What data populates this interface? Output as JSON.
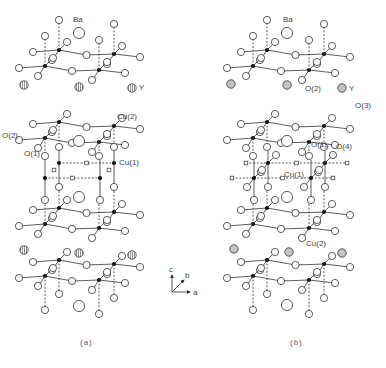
{
  "figure": {
    "width": 386,
    "height": 368,
    "colors": {
      "background": "#ffffff",
      "stroke": "#333333",
      "cu_fill": "#111111",
      "o_fill": "#ffffff",
      "ba_fill": "#ffffff",
      "y_fill_a": "#bbbbbb",
      "y_fill_b": "#c4c4c4",
      "label": "#444444"
    }
  },
  "panels": [
    {
      "id": "a",
      "caption": "(a)",
      "caption_pos": [
        80,
        345
      ],
      "cu_cols": [
        {
          "x": 45,
          "dx": 14
        },
        {
          "x": 99,
          "dx": 15
        }
      ],
      "bilayers": [
        {
          "y": 50,
          "sign": 1
        },
        {
          "y": 122,
          "sign": 1
        },
        {
          "y": 208,
          "sign": 1
        },
        {
          "y": 260,
          "sign": 1
        }
      ],
      "chain": {
        "y_upper": 163,
        "y_lower": 178,
        "x_left": 59,
        "x_right": 114,
        "dx_lower": -14
      },
      "ba": [
        [
          79,
          33
        ],
        [
          79,
          141
        ],
        [
          79,
          197
        ],
        [
          79,
          306
        ]
      ],
      "y": [
        [
          24,
          85
        ],
        [
          79,
          87
        ],
        [
          132,
          88
        ],
        [
          24,
          250
        ],
        [
          79,
          253
        ],
        [
          132,
          255
        ]
      ],
      "y_hatched": true,
      "labels": [
        {
          "text": "Ba",
          "x": 73,
          "y": 22
        },
        {
          "text": "Y",
          "x": 139,
          "y": 90
        },
        {
          "text": "Cu(2)",
          "x": 117,
          "y": 119
        },
        {
          "text": "O(2)",
          "x": 2,
          "y": 138
        },
        {
          "text": "O(1)",
          "x": 24,
          "y": 156
        },
        {
          "text": "Cu(1)",
          "x": 119,
          "y": 165
        }
      ]
    },
    {
      "id": "b",
      "caption": "(b)",
      "caption_pos": [
        290,
        345
      ],
      "cu_cols": [
        {
          "x": 253,
          "dx": 14
        },
        {
          "x": 309,
          "dx": 15
        }
      ],
      "bilayers": [
        {
          "y": 50,
          "sign": 1
        },
        {
          "y": 122,
          "sign": 1
        },
        {
          "y": 208,
          "sign": 1
        },
        {
          "y": 260,
          "sign": 1
        }
      ],
      "chain": {
        "y_upper": 163,
        "y_lower": 178,
        "x_left": 268,
        "x_right": 325,
        "dx_lower": -14
      },
      "ba": [
        [
          287,
          33
        ],
        [
          287,
          141
        ],
        [
          287,
          197
        ],
        [
          287,
          305
        ]
      ],
      "y": [
        [
          231,
          84
        ],
        [
          287,
          85
        ],
        [
          342,
          88
        ],
        [
          234,
          249
        ],
        [
          289,
          252
        ],
        [
          342,
          253
        ]
      ],
      "y_hatched": false,
      "labels": [
        {
          "text": "Ba",
          "x": 283,
          "y": 22
        },
        {
          "text": "O(2)",
          "x": 305,
          "y": 91
        },
        {
          "text": "Y",
          "x": 349,
          "y": 91
        },
        {
          "text": "O(3)",
          "x": 355,
          "y": 108
        },
        {
          "text": "O(1)",
          "x": 311,
          "y": 147
        },
        {
          "text": "O(4)",
          "x": 336,
          "y": 149
        },
        {
          "text": "Cu(1)",
          "x": 284,
          "y": 177
        },
        {
          "text": "Cu(2)",
          "x": 306,
          "y": 246
        }
      ]
    }
  ],
  "axes": {
    "origin": [
      172,
      292
    ],
    "c_label": "c",
    "b_label": "b",
    "a_label": "a",
    "c_tip": [
      172,
      275
    ],
    "b_tip": [
      184,
      280
    ],
    "a_tip": [
      190,
      292
    ]
  }
}
